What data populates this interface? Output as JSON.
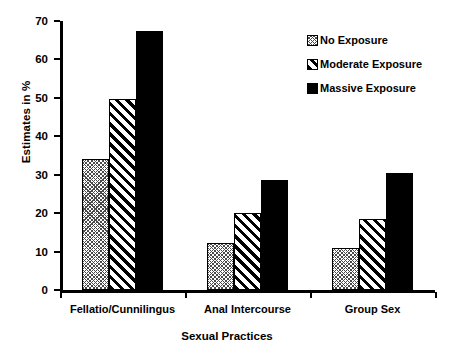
{
  "chart_data": {
    "type": "bar",
    "title": "",
    "xlabel": "Sexual Practices",
    "ylabel": "Estimates in %",
    "categories": [
      "Fellatio/Cunnilingus",
      "Anal Intercourse",
      "Group Sex"
    ],
    "series": [
      {
        "name": "No Exposure",
        "values": [
          34,
          12.2,
          11
        ],
        "fill": "light-crosshatch",
        "color": "#4a4a4a"
      },
      {
        "name": "Moderate Exposure",
        "values": [
          49.8,
          20,
          18.4
        ],
        "fill": "diagonal-stripes",
        "color": "#000000"
      },
      {
        "name": "Massive Exposure",
        "values": [
          67.4,
          28.6,
          30.5
        ],
        "fill": "solid",
        "color": "#000000"
      }
    ],
    "ylim": [
      0,
      70
    ],
    "yticks": [
      0,
      10,
      20,
      30,
      40,
      50,
      60,
      70
    ],
    "yticklabels": [
      "0",
      "10",
      "20",
      "30",
      "40",
      "50",
      "60",
      "70"
    ],
    "grid": false,
    "legend_position": "top-right"
  },
  "legend": {
    "entries": [
      {
        "label": "No Exposure"
      },
      {
        "label": "Moderate Exposure"
      },
      {
        "label": "Massive Exposure"
      }
    ]
  }
}
